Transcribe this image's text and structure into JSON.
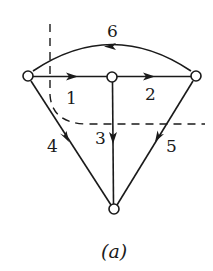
{
  "diagram": {
    "caption": "(a)",
    "nodes": [
      {
        "id": "left",
        "x": 28,
        "y": 76
      },
      {
        "id": "middle",
        "x": 112,
        "y": 77
      },
      {
        "id": "right",
        "x": 196,
        "y": 76
      },
      {
        "id": "bottom",
        "x": 114,
        "y": 209
      }
    ],
    "edges": [
      {
        "label": "1",
        "from": "left",
        "to": "middle"
      },
      {
        "label": "2",
        "from": "middle",
        "to": "right"
      },
      {
        "label": "3",
        "from": "middle",
        "to": "bottom"
      },
      {
        "label": "4",
        "from": "left",
        "to": "bottom"
      },
      {
        "label": "5",
        "from": "right",
        "to": "bottom"
      },
      {
        "label": "6",
        "from": "right",
        "to": "left",
        "curved": true
      }
    ],
    "cut": {
      "style": "dashed"
    },
    "colors": {
      "stroke": "#1a1a1a",
      "background": "#ffffff"
    }
  }
}
